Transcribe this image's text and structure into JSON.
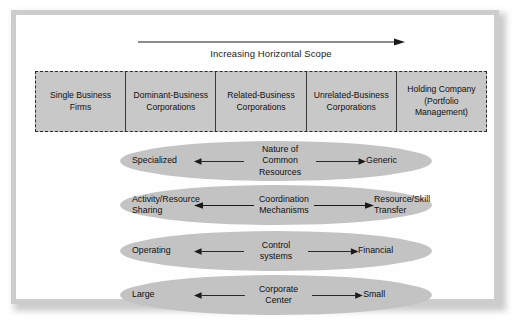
{
  "figure": {
    "scope_axis": {
      "label": "Increasing Horizontal Scope",
      "arrow": "right-arrow-icon"
    },
    "strategy_types": [
      {
        "label": "Single Business\nFirms"
      },
      {
        "label": "Dominant-Business\nCorporations"
      },
      {
        "label": "Related-Business\nCorporations"
      },
      {
        "label": "Unrelated-Business\nCorporations"
      },
      {
        "label": "Holding Company\n(Portfolio\nManagement)"
      }
    ],
    "dimensions": [
      {
        "name": "Nature of Common\nResources",
        "left": "Specialized",
        "right": "Generic",
        "left_arrow": "left-arrow-icon",
        "right_arrow": "right-arrow-icon"
      },
      {
        "name": "Coordination\nMechanisms",
        "left": "Activity/Resource\nSharing",
        "right": "Resource/Skill\nTransfer",
        "left_arrow": "left-arrow-icon",
        "right_arrow": "right-arrow-icon"
      },
      {
        "name": "Control systems",
        "left": "Operating",
        "right": "Financial",
        "left_arrow": "left-arrow-icon",
        "right_arrow": "right-arrow-icon"
      },
      {
        "name": "Corporate Center",
        "left": "Large",
        "right": "Small",
        "left_arrow": "left-arrow-icon",
        "right_arrow": "right-arrow-icon"
      }
    ],
    "colors": {
      "cell_fill": "#c8c8c8",
      "ellipse_fill": "#c3c3c3",
      "frame": "#cdcdcd",
      "text": "#101010",
      "line": "#1a1a1a"
    }
  }
}
